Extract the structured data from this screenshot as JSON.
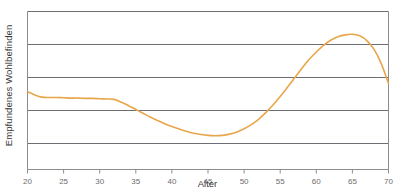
{
  "chart_data": {
    "type": "line",
    "title": "",
    "subtitle": "",
    "xlabel": "Alter",
    "ylabel": "Empfundenes Wohlbefinden",
    "xlim": [
      20,
      70
    ],
    "ylim": [
      0,
      5
    ],
    "xticks": [
      20,
      25,
      30,
      35,
      40,
      45,
      50,
      55,
      60,
      65,
      70
    ],
    "xticklabels": [
      "20",
      "25",
      "30",
      "35",
      "40",
      "45",
      "50",
      "55",
      "60",
      "65",
      "70"
    ],
    "yticks": [],
    "yticklabels": [],
    "grid": "horizontal",
    "gridline_count": 5,
    "legend": "none",
    "line_color": "#E8A64A",
    "grid_color": "#6b6f73",
    "axis_color": "#8a8d90",
    "series": [
      {
        "name": "Empfundenes Wohlbefinden",
        "x": [
          20,
          21,
          22,
          23,
          24,
          25,
          26,
          27,
          28,
          29,
          30,
          31,
          32,
          33,
          34,
          35,
          36,
          37,
          38,
          39,
          40,
          41,
          42,
          43,
          44,
          45,
          46,
          47,
          48,
          49,
          50,
          51,
          52,
          53,
          54,
          55,
          56,
          57,
          58,
          59,
          60,
          61,
          62,
          63,
          64,
          65,
          66,
          67,
          68,
          69,
          70
        ],
        "values": [
          2.46,
          2.36,
          2.29,
          2.28,
          2.28,
          2.27,
          2.26,
          2.26,
          2.25,
          2.25,
          2.24,
          2.23,
          2.22,
          2.13,
          2.02,
          1.9,
          1.78,
          1.66,
          1.55,
          1.45,
          1.36,
          1.28,
          1.21,
          1.15,
          1.11,
          1.08,
          1.07,
          1.08,
          1.12,
          1.19,
          1.29,
          1.42,
          1.59,
          1.8,
          2.04,
          2.31,
          2.6,
          2.9,
          3.2,
          3.48,
          3.72,
          3.93,
          4.09,
          4.2,
          4.26,
          4.28,
          4.23,
          4.08,
          3.8,
          3.35,
          2.72
        ]
      }
    ],
    "annotations": []
  },
  "axes": {
    "y_axis_label": "Empfundenes Wohlbefinden",
    "x_axis_label": "Alter"
  }
}
